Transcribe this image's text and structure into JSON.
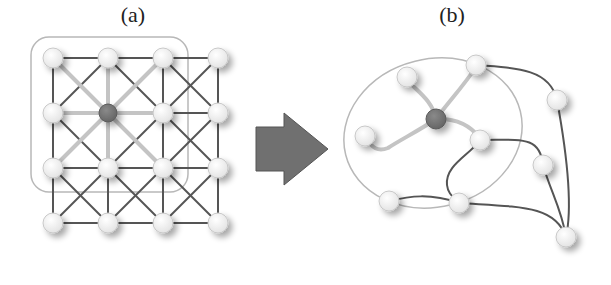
{
  "panels": {
    "a": {
      "label": "(a)",
      "description": "4x4 regular grid with orthogonal and diagonal connections; highlighted neighborhood (rounded rectangle) around a dark center node"
    },
    "b": {
      "label": "(b)",
      "description": "Irregular graph; highlighted neighborhood (ellipse) around a dark center node with curved edges"
    }
  },
  "arrow": {
    "direction": "right",
    "color": "#6e6e6e"
  },
  "colors": {
    "node_fill": "#f7f7f7",
    "node_stroke": "#bdbdbd",
    "center_node": "#7a7a7a",
    "edge": "#555555",
    "highlight_edge": "#bcbcbc",
    "region_outline": "#b5b5b5"
  }
}
